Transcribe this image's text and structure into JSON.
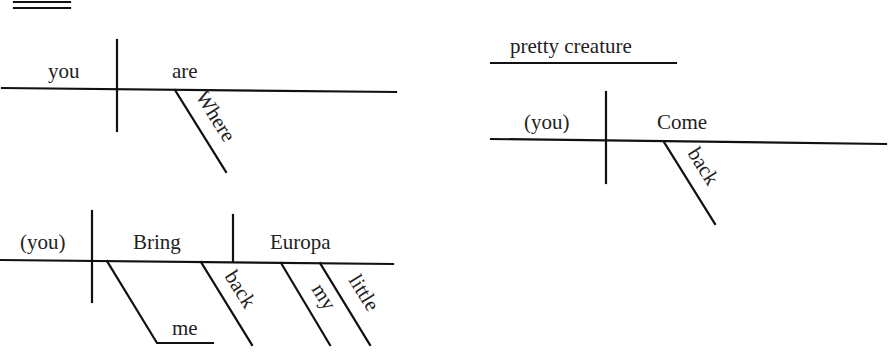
{
  "diagrams": [
    {
      "id": "where-are-you",
      "subject": "you",
      "predicate": "are",
      "modifiers": [
        {
          "word": "Where",
          "modifies": "are"
        }
      ]
    },
    {
      "id": "come-back",
      "subject": "(you)",
      "predicate": "Come",
      "modifiers": [
        {
          "word": "back",
          "modifies": "Come"
        }
      ],
      "direct_address": "pretty creature"
    },
    {
      "id": "bring-me-back-europa",
      "subject": "(you)",
      "predicate": "Bring",
      "direct_object": "Europa",
      "indirect_object": "me",
      "modifiers": [
        {
          "word": "back",
          "modifies": "Bring"
        },
        {
          "word": "my",
          "modifies": "Europa"
        },
        {
          "word": "little",
          "modifies": "Europa"
        }
      ]
    }
  ],
  "colors": {
    "line": "#111111",
    "text": "#222222",
    "background": "#ffffff"
  }
}
